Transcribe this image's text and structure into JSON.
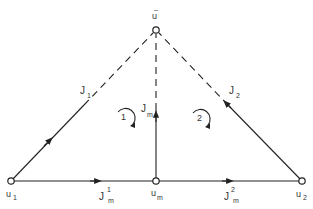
{
  "diagram": {
    "type": "network-graph",
    "colors": {
      "line": "#222222",
      "background": "#ffffff"
    },
    "nodes": [
      {
        "id": "u_bar",
        "label": "u",
        "accent": "bar",
        "x": 156,
        "y": 30
      },
      {
        "id": "u1",
        "label": "u",
        "sub": "1",
        "x": 11,
        "y": 181
      },
      {
        "id": "um",
        "label": "u",
        "sub": "m",
        "x": 156,
        "y": 181
      },
      {
        "id": "u2",
        "label": "u",
        "sub": "2",
        "x": 302,
        "y": 181
      }
    ],
    "edges": [
      {
        "from": "u1",
        "to": "u_bar",
        "style": "solid-then-dashed",
        "label": "J",
        "sub": "1",
        "direction": "toward u_bar"
      },
      {
        "from": "u2",
        "to": "u_bar",
        "style": "solid-then-dashed",
        "label": "J",
        "sub": "2",
        "direction": "toward u_bar"
      },
      {
        "from": "um",
        "to": "u_bar",
        "style": "solid-then-dashed",
        "label": "J",
        "sub": "m",
        "direction": "toward u_bar"
      },
      {
        "from": "u1",
        "to": "um",
        "style": "solid",
        "label": "J",
        "sup": "1",
        "sub": "m",
        "direction": "toward um"
      },
      {
        "from": "um",
        "to": "u2",
        "style": "solid",
        "label": "J",
        "sup": "2",
        "sub": "m",
        "direction": "toward u2"
      }
    ],
    "loops": [
      {
        "label": "1",
        "direction": "clockwise"
      },
      {
        "label": "2",
        "direction": "clockwise"
      }
    ],
    "labels": {
      "top_node": "u",
      "top_node_bar": "–",
      "u1_main": "u",
      "u1_sub": "1",
      "um_main": "u",
      "um_sub": "m",
      "u2_main": "u",
      "u2_sub": "2",
      "j1_main": "J",
      "j1_sub": "1",
      "j2_main": "J",
      "j2_sub": "2",
      "jm_main": "J",
      "jm_sub": "m",
      "jm1_main": "J",
      "jm1_sup": "1",
      "jm1_sub": "m",
      "jm2_main": "J",
      "jm2_sup": "2",
      "jm2_sub": "m",
      "loop1": "1",
      "loop2": "2"
    }
  }
}
